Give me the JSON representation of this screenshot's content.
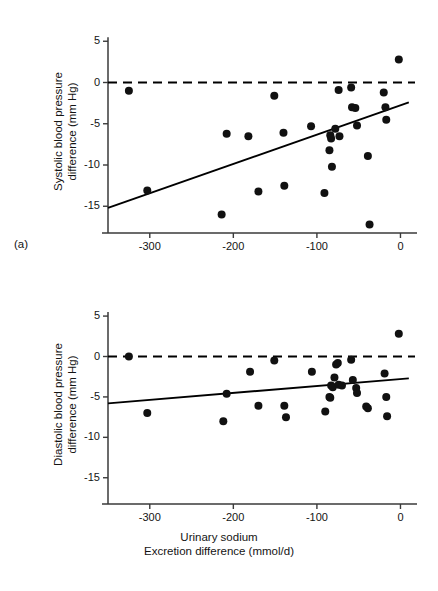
{
  "figure": {
    "panels": [
      {
        "tag": "(a)",
        "ylabel_line1": "Systolic blood pressure",
        "ylabel_line2": "difference (mm Hg)"
      },
      {
        "tag": "(b)",
        "ylabel_line1": "Diastolic blood pressure",
        "ylabel_line2": "difference (mm Hg)"
      }
    ],
    "xlabel_line1": "Urinary sodium",
    "xlabel_line2": "Excretion difference (mmol/d)",
    "marker_color": "#111111",
    "line_color": "#000000",
    "axis_color": "#3a3a3a"
  },
  "chart_data": [
    {
      "type": "scatter",
      "panel": "a",
      "title": "Systolic blood pressure difference vs urinary sodium excretion difference",
      "xlabel": "Urinary sodium Excretion difference (mmol/d)",
      "ylabel": "Systolic blood pressure difference (mm Hg)",
      "xlim": [
        -350,
        15
      ],
      "ylim": [
        -18,
        6
      ],
      "xticks": [
        -300,
        -200,
        -100,
        0
      ],
      "yticks": [
        5,
        0,
        -5,
        -10,
        -15
      ],
      "grid": false,
      "legend": "none",
      "reference_line": {
        "type": "dashed-horizontal",
        "y": 0
      },
      "regression_line": {
        "type": "solid",
        "x": [
          -350,
          10
        ],
        "y": [
          -15.2,
          -2.4
        ]
      },
      "points": [
        {
          "x": -325,
          "y": -1.0
        },
        {
          "x": -303,
          "y": -13.1
        },
        {
          "x": -214,
          "y": -16.0
        },
        {
          "x": -208,
          "y": -6.2
        },
        {
          "x": -182,
          "y": -6.5
        },
        {
          "x": -170,
          "y": -13.2
        },
        {
          "x": -151,
          "y": -1.6
        },
        {
          "x": -140,
          "y": -6.1
        },
        {
          "x": -139,
          "y": -12.5
        },
        {
          "x": -107,
          "y": -5.3
        },
        {
          "x": -91,
          "y": -13.4
        },
        {
          "x": -85,
          "y": -8.2
        },
        {
          "x": -84,
          "y": -6.4
        },
        {
          "x": -83,
          "y": -6.8
        },
        {
          "x": -82,
          "y": -10.2
        },
        {
          "x": -78,
          "y": -5.6
        },
        {
          "x": -74,
          "y": -0.9
        },
        {
          "x": -73,
          "y": -6.5
        },
        {
          "x": -59,
          "y": -0.6
        },
        {
          "x": -58,
          "y": -3.0
        },
        {
          "x": -54,
          "y": -3.1
        },
        {
          "x": -52,
          "y": -5.2
        },
        {
          "x": -39,
          "y": -8.9
        },
        {
          "x": -37,
          "y": -17.2
        },
        {
          "x": -20,
          "y": -1.2
        },
        {
          "x": -18,
          "y": -3.0
        },
        {
          "x": -17,
          "y": -4.5
        },
        {
          "x": -2,
          "y": 2.8
        }
      ]
    },
    {
      "type": "scatter",
      "panel": "b",
      "title": "Diastolic blood pressure difference vs urinary sodium excretion difference",
      "xlabel": "Urinary sodium Excretion difference (mmol/d)",
      "ylabel": "Diastolic blood pressure difference (mm Hg)",
      "xlim": [
        -350,
        15
      ],
      "ylim": [
        -18,
        6
      ],
      "xticks": [
        -300,
        -200,
        -100,
        0
      ],
      "yticks": [
        5,
        0,
        -5,
        -10,
        -15
      ],
      "grid": false,
      "legend": "none",
      "reference_line": {
        "type": "dashed-horizontal",
        "y": 0
      },
      "regression_line": {
        "type": "solid",
        "x": [
          -350,
          10
        ],
        "y": [
          -5.8,
          -2.7
        ]
      },
      "points": [
        {
          "x": -325,
          "y": 0.0
        },
        {
          "x": -303,
          "y": -7.0
        },
        {
          "x": -212,
          "y": -8.0
        },
        {
          "x": -208,
          "y": -4.6
        },
        {
          "x": -180,
          "y": -1.9
        },
        {
          "x": -170,
          "y": -6.1
        },
        {
          "x": -151,
          "y": -0.5
        },
        {
          "x": -139,
          "y": -6.1
        },
        {
          "x": -137,
          "y": -7.5
        },
        {
          "x": -106,
          "y": -1.9
        },
        {
          "x": -90,
          "y": -6.8
        },
        {
          "x": -85,
          "y": -5.0
        },
        {
          "x": -84,
          "y": -5.1
        },
        {
          "x": -83,
          "y": -3.6
        },
        {
          "x": -81,
          "y": -3.8
        },
        {
          "x": -79,
          "y": -2.6
        },
        {
          "x": -77,
          "y": -1.0
        },
        {
          "x": -75,
          "y": -0.8
        },
        {
          "x": -74,
          "y": -3.5
        },
        {
          "x": -70,
          "y": -3.6
        },
        {
          "x": -59,
          "y": -0.4
        },
        {
          "x": -57,
          "y": -2.9
        },
        {
          "x": -53,
          "y": -3.9
        },
        {
          "x": -52,
          "y": -4.5
        },
        {
          "x": -41,
          "y": -6.2
        },
        {
          "x": -39,
          "y": -6.4
        },
        {
          "x": -19,
          "y": -2.1
        },
        {
          "x": -17,
          "y": -5.0
        },
        {
          "x": -16,
          "y": -7.4
        },
        {
          "x": -2,
          "y": 2.8
        }
      ]
    }
  ]
}
